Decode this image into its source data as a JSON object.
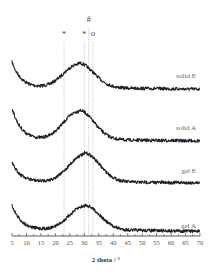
{
  "chart_data": {
    "type": "line",
    "title": "",
    "xlabel": "2 theta / °",
    "ylabel": "",
    "xlim": [
      5,
      70
    ],
    "x_ticks": [
      5,
      10,
      15,
      20,
      25,
      30,
      35,
      40,
      45,
      50,
      55,
      60,
      65,
      70
    ],
    "grid": false,
    "legend": "inline labels at right of each trace",
    "stacked_offset": true,
    "series": [
      {
        "name": "solid E",
        "label_y": 78,
        "baseline": 88,
        "start": 62,
        "min_x": 15,
        "peak_x": 28,
        "peak": 63,
        "end": 91
      },
      {
        "name": "solid A",
        "label_y": 130,
        "baseline": 140,
        "start": 108,
        "min_x": 16,
        "peak_x": 28,
        "peak": 110,
        "end": 142
      },
      {
        "name": "gel E",
        "label_y": 173,
        "baseline": 182,
        "start": 163,
        "min_x": 15,
        "peak_x": 30,
        "peak": 153,
        "end": 184
      },
      {
        "name": "gel A",
        "label_y": 228,
        "baseline": 230,
        "start": 205,
        "min_x": 14,
        "peak_x": 30,
        "peak": 205,
        "end": 233
      }
    ],
    "annotations": [
      {
        "symbol": "*",
        "x": 23,
        "dotted_line": true
      },
      {
        "symbol": "*",
        "x": 30,
        "dotted_line": true
      },
      {
        "symbol": "#",
        "x": 31.5,
        "dotted_line": true
      },
      {
        "symbol": "°",
        "x": 33,
        "dotted_line": true
      }
    ]
  }
}
